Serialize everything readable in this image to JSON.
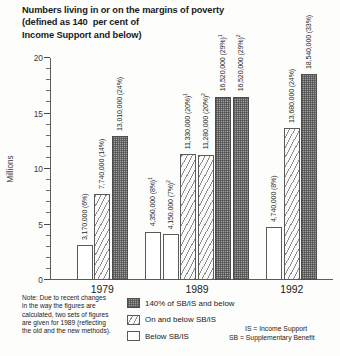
{
  "title": {
    "line1": "Numbers living in or on the margins of poverty",
    "line2": "(defined as 140  per cent of",
    "line3": "Income Support and below)"
  },
  "axis": {
    "ylabel": "Millions",
    "yticks": [
      "0",
      "5",
      "10",
      "15",
      "20"
    ]
  },
  "legend": [
    {
      "key": "s-140",
      "label": "140% of SB/IS and below"
    },
    {
      "key": "s-onbelow",
      "label": "On and below SB/IS"
    },
    {
      "key": "s-below",
      "label": "Below SB/IS"
    }
  ],
  "note": "Note: Due to recent changes in the way the figures are calculated, two sets of  figures are given for 1989 (reflecting the old and the new methods).",
  "key": {
    "is": "IS = Income Support",
    "sb": "SB = Supplementary Benefit"
  },
  "chart_data": {
    "type": "bar",
    "title": "Numbers living in or on the margins of poverty (defined as 140 per cent of Income Support and below)",
    "xlabel": "",
    "ylabel": "Millions",
    "ylim": [
      0,
      20
    ],
    "ytick_step": 5,
    "minor_tick_step": 1,
    "grid": false,
    "legend_position": "bottom-center",
    "categories": [
      "1979",
      "1989",
      "1992"
    ],
    "bars": [
      {
        "group": "1979",
        "series": "Below SB/IS",
        "value": 3.17,
        "label": "3,170,000 (6%)",
        "footnote": ""
      },
      {
        "group": "1979",
        "series": "On and below SB/IS",
        "value": 7.74,
        "label": "7,740,000 (14%)",
        "footnote": ""
      },
      {
        "group": "1979",
        "series": "140% of SB/IS and below",
        "value": 13.01,
        "label": "13,010,000 (24%)",
        "footnote": ""
      },
      {
        "group": "1989",
        "series": "Below SB/IS",
        "value": 4.35,
        "label": "4,350,000 (8%)",
        "footnote": "1"
      },
      {
        "group": "1989",
        "series": "Below SB/IS",
        "value": 4.15,
        "label": "4,150,000 (7%)",
        "footnote": "2"
      },
      {
        "group": "1989",
        "series": "On and below SB/IS",
        "value": 11.33,
        "label": "11,330,000 (20%)",
        "footnote": "1"
      },
      {
        "group": "1989",
        "series": "On and below SB/IS",
        "value": 11.28,
        "label": "11,280,000 (20%)",
        "footnote": "2"
      },
      {
        "group": "1989",
        "series": "140% of SB/IS and below",
        "value": 16.52,
        "label": "16,520,000 (29%)",
        "footnote": "1"
      },
      {
        "group": "1989",
        "series": "140% of SB/IS and below",
        "value": 16.52,
        "label": "16,520,000 (29%)",
        "footnote": "2"
      },
      {
        "group": "1992",
        "series": "Below SB/IS",
        "value": 4.74,
        "label": "4,740,000 (8%)",
        "footnote": ""
      },
      {
        "group": "1992",
        "series": "On and below SB/IS",
        "value": 13.68,
        "label": "13,680,000 (24%)",
        "footnote": ""
      },
      {
        "group": "1992",
        "series": "140% of SB/IS and below",
        "value": 18.54,
        "label": "18,540,000 (33%)",
        "footnote": ""
      }
    ]
  }
}
